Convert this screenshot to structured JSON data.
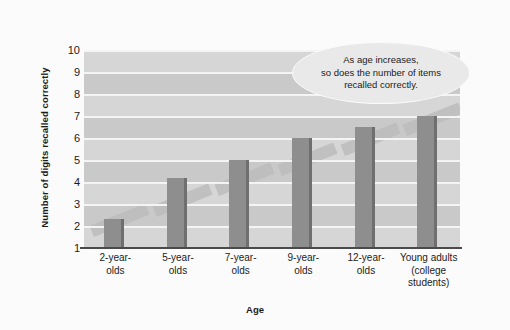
{
  "chart_data": {
    "type": "bar",
    "title": "",
    "xlabel": "Age",
    "ylabel": "Number of digits recalled correctly",
    "categories": [
      "2-year-\nolds",
      "5-year-\nolds",
      "7-year-\nolds",
      "9-year-\nolds",
      "12-year-\nolds",
      "Young adults\n(college\nstudents)"
    ],
    "values": [
      2.3,
      4.2,
      5.0,
      6.0,
      6.5,
      7.0
    ],
    "ylim": [
      1,
      10
    ],
    "yticks": [
      10,
      9,
      8,
      7,
      6,
      5,
      4,
      3,
      2,
      1
    ],
    "grid": true,
    "legend": "none",
    "annotation": "As age increases,\nso does  the number of items\nrecalled correctly.",
    "colors": {
      "bar": "#8e8e8e",
      "bar_edge": "#6f6f6f",
      "plot_background": "#cfcfcf",
      "gridline": "#f4f4f4",
      "axis": "#4a4a4a",
      "text": "#1b1b1b",
      "page_background": "#fbfbfb",
      "callout_fill": "#e9e9e9"
    }
  }
}
